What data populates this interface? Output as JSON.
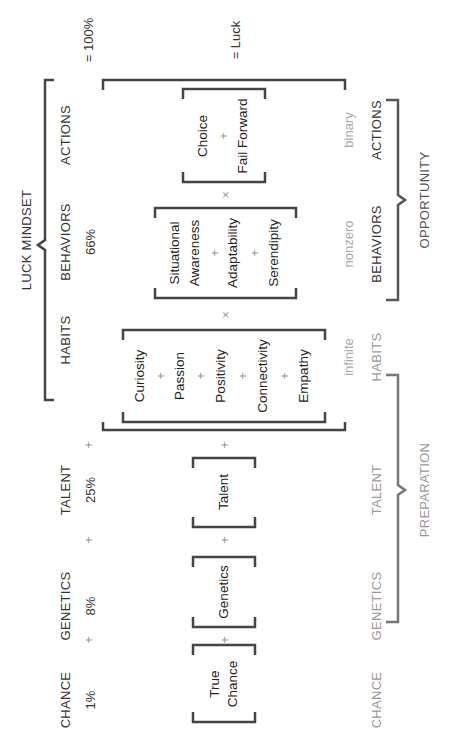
{
  "equation_top": {
    "title": "LUCK MINDSET",
    "columns": [
      {
        "label": "CHANCE",
        "pct": "1%"
      },
      {
        "label": "GENETICS",
        "pct": "8%"
      },
      {
        "label": "TALENT",
        "pct": "25%"
      },
      {
        "label": "HABITS",
        "pct": ""
      },
      {
        "label": "BEHAVIORS",
        "pct": "66%"
      },
      {
        "label": "ACTIONS",
        "pct": ""
      }
    ],
    "plus": "+",
    "result": "= 100%"
  },
  "equation_main": {
    "groups": {
      "true_chance": [
        "True",
        "Chance"
      ],
      "genetics": "Genetics",
      "talent": "Talent",
      "habits": [
        "Curiosity",
        "+",
        "Passion",
        "+",
        "Positivity",
        "+",
        "Connectivity",
        "+",
        "Empathy"
      ],
      "behaviors": [
        "Situational",
        "Awareness",
        "+",
        "Adaptability",
        "+",
        "Serendipity"
      ],
      "actions": [
        "Choice",
        "+",
        "Fail Forward"
      ]
    },
    "plus": "+",
    "times": "×",
    "result": "= Luck",
    "qualifiers": {
      "habits": "infinite",
      "behaviors": "nonzero",
      "actions": "binary"
    }
  },
  "bottom": {
    "labels": [
      "CHANCE",
      "GENETICS",
      "TALENT",
      "HABITS",
      "BEHAVIORS",
      "ACTIONS"
    ],
    "preparation": "PREPARATION",
    "opportunity": "OPPORTUNITY"
  },
  "colors": {
    "line": "#444444",
    "grey_line": "#777777",
    "text": "#333333",
    "muted": "#999999"
  }
}
